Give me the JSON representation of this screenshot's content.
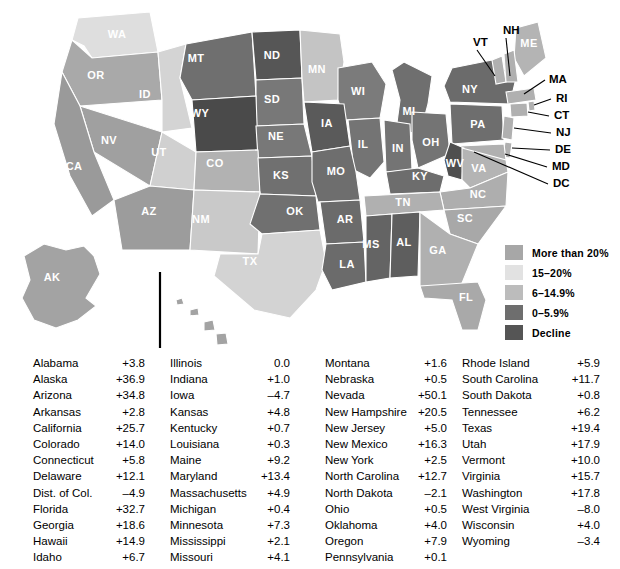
{
  "map": {
    "title_labels": [
      "WA",
      "OR",
      "ID",
      "MT",
      "ND",
      "MN",
      "WI",
      "MI",
      "NY",
      "ME",
      "SD",
      "WY",
      "NE",
      "IA",
      "IL",
      "IN",
      "OH",
      "PA",
      "NV",
      "UT",
      "CO",
      "KS",
      "MO",
      "KY",
      "WV",
      "VA",
      "NC",
      "CA",
      "AZ",
      "NM",
      "OK",
      "AR",
      "TN",
      "SC",
      "TX",
      "LA",
      "MS",
      "AL",
      "GA",
      "FL",
      "AK",
      "HI"
    ],
    "states": [
      {
        "id": "WA",
        "label": "WA",
        "fill": "#dedede",
        "lx": 117,
        "ly": 38
      },
      {
        "id": "OR",
        "label": "OR",
        "fill": "#a9a9a9",
        "lx": 96,
        "ly": 79
      },
      {
        "id": "ID",
        "label": "ID",
        "fill": "#d4d4d4",
        "lx": 145,
        "ly": 98
      },
      {
        "id": "MT",
        "label": "MT",
        "fill": "#6f6f6f",
        "lx": 196,
        "ly": 62
      },
      {
        "id": "ND",
        "label": "ND",
        "fill": "#565656",
        "lx": 272,
        "ly": 59
      },
      {
        "id": "MN",
        "label": "MN",
        "fill": "#c4c4c4",
        "lx": 317,
        "ly": 73
      },
      {
        "id": "WI",
        "label": "WI",
        "fill": "#7b7b7b",
        "lx": 358,
        "ly": 95
      },
      {
        "id": "MI",
        "label": "MI",
        "fill": "#6f6f6f",
        "lx": 409,
        "ly": 115
      },
      {
        "id": "NY",
        "label": "NY",
        "fill": "#6b6b6b",
        "lx": 470,
        "ly": 93
      },
      {
        "id": "ME",
        "label": "ME",
        "fill": "#b4b4b4",
        "lx": 529,
        "ly": 47
      },
      {
        "id": "SD",
        "label": "SD",
        "fill": "#787878",
        "lx": 272,
        "ly": 103
      },
      {
        "id": "WY",
        "label": "WY",
        "fill": "#4a4a4a",
        "lx": 200,
        "ly": 117
      },
      {
        "id": "NE",
        "label": "NE",
        "fill": "#787878",
        "lx": 276,
        "ly": 140
      },
      {
        "id": "IA",
        "label": "IA",
        "fill": "#5a5a5a",
        "lx": 327,
        "ly": 127
      },
      {
        "id": "IL",
        "label": "IL",
        "fill": "#747474",
        "lx": 363,
        "ly": 148
      },
      {
        "id": "IN",
        "label": "IN",
        "fill": "#747474",
        "lx": 398,
        "ly": 152
      },
      {
        "id": "OH",
        "label": "OH",
        "fill": "#747474",
        "lx": 431,
        "ly": 146
      },
      {
        "id": "PA",
        "label": "PA",
        "fill": "#6e6e6e",
        "lx": 478,
        "ly": 128
      },
      {
        "id": "NV",
        "label": "NV",
        "fill": "#a0a0a0",
        "lx": 109,
        "ly": 144
      },
      {
        "id": "UT",
        "label": "UT",
        "fill": "#d0d0d0",
        "lx": 159,
        "ly": 156
      },
      {
        "id": "CO",
        "label": "CO",
        "fill": "#b2b2b2",
        "lx": 215,
        "ly": 167
      },
      {
        "id": "KS",
        "label": "KS",
        "fill": "#707070",
        "lx": 281,
        "ly": 179
      },
      {
        "id": "MO",
        "label": "MO",
        "fill": "#6e6e6e",
        "lx": 336,
        "ly": 175
      },
      {
        "id": "KY",
        "label": "KY",
        "fill": "#6d6d6d",
        "lx": 420,
        "ly": 180
      },
      {
        "id": "WV",
        "label": "WV",
        "fill": "#4f4f4f",
        "lx": 455,
        "ly": 167
      },
      {
        "id": "VA",
        "label": "VA",
        "fill": "#b4b4b4",
        "lx": 479,
        "ly": 172
      },
      {
        "id": "NC",
        "label": "NC",
        "fill": "#aeaeae",
        "lx": 478,
        "ly": 198
      },
      {
        "id": "CA",
        "label": "CA",
        "fill": "#9a9a9a",
        "lx": 74,
        "ly": 170
      },
      {
        "id": "AZ",
        "label": "AZ",
        "fill": "#9c9c9c",
        "lx": 149,
        "ly": 215
      },
      {
        "id": "NM",
        "label": "NM",
        "fill": "#c9c9c9",
        "lx": 201,
        "ly": 223
      },
      {
        "id": "OK",
        "label": "OK",
        "fill": "#707070",
        "lx": 295,
        "ly": 215
      },
      {
        "id": "AR",
        "label": "AR",
        "fill": "#6b6b6b",
        "lx": 345,
        "ly": 223
      },
      {
        "id": "TN",
        "label": "TN",
        "fill": "#b0b0b0",
        "lx": 403,
        "ly": 206
      },
      {
        "id": "SC",
        "label": "SC",
        "fill": "#a8a8a8",
        "lx": 465,
        "ly": 222
      },
      {
        "id": "TX",
        "label": "TX",
        "fill": "#d3d3d3",
        "lx": 250,
        "ly": 265
      },
      {
        "id": "LA",
        "label": "LA",
        "fill": "#6b6b6b",
        "lx": 347,
        "ly": 268
      },
      {
        "id": "MS",
        "label": "MS",
        "fill": "#646464",
        "lx": 371,
        "ly": 248
      },
      {
        "id": "AL",
        "label": "AL",
        "fill": "#5e5e5e",
        "lx": 404,
        "ly": 246
      },
      {
        "id": "GA",
        "label": "GA",
        "fill": "#b0b0b0",
        "lx": 438,
        "ly": 254
      },
      {
        "id": "FL",
        "label": "FL",
        "fill": "#a9a9a9",
        "lx": 466,
        "ly": 301
      },
      {
        "id": "AK",
        "label": "AK",
        "fill": "#a3a3a3",
        "lx": 52,
        "ly": 281
      },
      {
        "id": "HI",
        "label": "HI",
        "fill": "#a3a3a3",
        "lx": 196,
        "ly": 323
      }
    ],
    "callouts": [
      {
        "id": "VT",
        "label": "VT",
        "tx": 473,
        "ty": 46
      },
      {
        "id": "NH",
        "label": "NH",
        "tx": 503,
        "ty": 34
      },
      {
        "id": "MA",
        "label": "MA",
        "tx": 549,
        "ty": 83
      },
      {
        "id": "RI",
        "label": "RI",
        "tx": 556,
        "ty": 102
      },
      {
        "id": "CT",
        "label": "CT",
        "tx": 554,
        "ty": 119
      },
      {
        "id": "NJ",
        "label": "NJ",
        "tx": 556,
        "ty": 136
      },
      {
        "id": "DE",
        "label": "DE",
        "tx": 555,
        "ty": 153
      },
      {
        "id": "MD",
        "label": "MD",
        "tx": 552,
        "ty": 170
      },
      {
        "id": "DC",
        "label": "DC",
        "tx": 553,
        "ty": 187
      }
    ]
  },
  "legend": {
    "items": [
      {
        "label": "More than 20%",
        "color": "#a7a7a7"
      },
      {
        "label": "15–20%",
        "color": "#e2e2e2"
      },
      {
        "label": "6–14.9%",
        "color": "#bcbcbc"
      },
      {
        "label": "0–5.9%",
        "color": "#6e6e6e"
      },
      {
        "label": "Decline",
        "color": "#555555"
      }
    ]
  },
  "table": {
    "columns": [
      {
        "rows": [
          {
            "name": "Alabama",
            "value": "+3.8"
          },
          {
            "name": "Alaska",
            "value": "+36.9"
          },
          {
            "name": "Arizona",
            "value": "+34.8"
          },
          {
            "name": "Arkansas",
            "value": "+2.8"
          },
          {
            "name": "California",
            "value": "+25.7"
          },
          {
            "name": "Colorado",
            "value": "+14.0"
          },
          {
            "name": "Connecticut",
            "value": "+5.8"
          },
          {
            "name": "Delaware",
            "value": "+12.1"
          },
          {
            "name": "Dist. of Col.",
            "value": "–4.9"
          },
          {
            "name": "Florida",
            "value": "+32.7"
          },
          {
            "name": "Georgia",
            "value": "+18.6"
          },
          {
            "name": "Hawaii",
            "value": "+14.9"
          },
          {
            "name": "Idaho",
            "value": "+6.7"
          }
        ]
      },
      {
        "rows": [
          {
            "name": "Illinois",
            "value": "0.0"
          },
          {
            "name": "Indiana",
            "value": "+1.0"
          },
          {
            "name": "Iowa",
            "value": "–4.7"
          },
          {
            "name": "Kansas",
            "value": "+4.8"
          },
          {
            "name": "Kentucky",
            "value": "+0.7"
          },
          {
            "name": "Louisiana",
            "value": "+0.3"
          },
          {
            "name": "Maine",
            "value": "+9.2"
          },
          {
            "name": "Maryland",
            "value": "+13.4"
          },
          {
            "name": "Massachusetts",
            "value": "+4.9"
          },
          {
            "name": "Michigan",
            "value": "+0.4"
          },
          {
            "name": "Minnesota",
            "value": "+7.3"
          },
          {
            "name": "Mississippi",
            "value": "+2.1"
          },
          {
            "name": "Missouri",
            "value": "+4.1"
          }
        ]
      },
      {
        "rows": [
          {
            "name": "Montana",
            "value": "+1.6"
          },
          {
            "name": "Nebraska",
            "value": "+0.5"
          },
          {
            "name": "Nevada",
            "value": "+50.1"
          },
          {
            "name": "New Hampshire",
            "value": "+20.5"
          },
          {
            "name": "New Jersey",
            "value": "+5.0"
          },
          {
            "name": "New Mexico",
            "value": "+16.3"
          },
          {
            "name": "New York",
            "value": "+2.5"
          },
          {
            "name": "North Carolina",
            "value": "+12.7"
          },
          {
            "name": "North Dakota",
            "value": "–2.1"
          },
          {
            "name": "Ohio",
            "value": "+0.5"
          },
          {
            "name": "Oklahoma",
            "value": "+4.0"
          },
          {
            "name": "Oregon",
            "value": "+7.9"
          },
          {
            "name": "Pennsylvania",
            "value": "+0.1"
          }
        ]
      },
      {
        "rows": [
          {
            "name": "Rhode Island",
            "value": "+5.9"
          },
          {
            "name": "South Carolina",
            "value": "+11.7"
          },
          {
            "name": "South Dakota",
            "value": "+0.8"
          },
          {
            "name": "Tennessee",
            "value": "+6.2"
          },
          {
            "name": "Texas",
            "value": "+19.4"
          },
          {
            "name": "Utah",
            "value": "+17.9"
          },
          {
            "name": "Vermont",
            "value": "+10.0"
          },
          {
            "name": "Virginia",
            "value": "+15.7"
          },
          {
            "name": "Washington",
            "value": "+17.8"
          },
          {
            "name": "West Virginia",
            "value": "–8.0"
          },
          {
            "name": "Wisconsin",
            "value": "+4.0"
          },
          {
            "name": "Wyoming",
            "value": "–3.4"
          }
        ]
      }
    ]
  },
  "chart_data": {
    "type": "map",
    "unit": "percent",
    "legend_bins": [
      "More than 20%",
      "15–20%",
      "6–14.9%",
      "0–5.9%",
      "Decline"
    ],
    "values": {
      "Alabama": 3.8,
      "Alaska": 36.9,
      "Arizona": 34.8,
      "Arkansas": 2.8,
      "California": 25.7,
      "Colorado": 14.0,
      "Connecticut": 5.8,
      "Delaware": 12.1,
      "Dist. of Col.": -4.9,
      "Florida": 32.7,
      "Georgia": 18.6,
      "Hawaii": 14.9,
      "Idaho": 6.7,
      "Illinois": 0.0,
      "Indiana": 1.0,
      "Iowa": -4.7,
      "Kansas": 4.8,
      "Kentucky": 0.7,
      "Louisiana": 0.3,
      "Maine": 9.2,
      "Maryland": 13.4,
      "Massachusetts": 4.9,
      "Michigan": 0.4,
      "Minnesota": 7.3,
      "Mississippi": 2.1,
      "Missouri": 4.1,
      "Montana": 1.6,
      "Nebraska": 0.5,
      "Nevada": 50.1,
      "New Hampshire": 20.5,
      "New Jersey": 5.0,
      "New Mexico": 16.3,
      "New York": 2.5,
      "North Carolina": 12.7,
      "North Dakota": -2.1,
      "Ohio": 0.5,
      "Oklahoma": 4.0,
      "Oregon": 7.9,
      "Pennsylvania": 0.1,
      "Rhode Island": 5.9,
      "South Carolina": 11.7,
      "South Dakota": 0.8,
      "Tennessee": 6.2,
      "Texas": 19.4,
      "Utah": 17.9,
      "Vermont": 10.0,
      "Virginia": 15.7,
      "Washington": 17.8,
      "West Virginia": -8.0,
      "Wisconsin": 4.0,
      "Wyoming": -3.4
    }
  }
}
